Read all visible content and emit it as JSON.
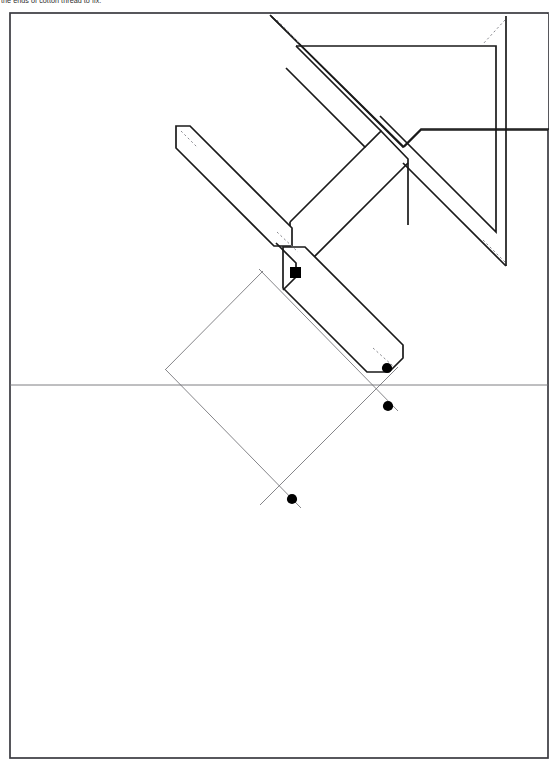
{
  "document": {
    "caption_text": "the ends of cotton thread to fix.",
    "page_width": 555,
    "page_height": 766,
    "background_color": "#ffffff"
  },
  "frame": {
    "name": "page-border",
    "x": 10,
    "y": 13,
    "width": 538,
    "height": 745,
    "stroke_color": "#3a3a40",
    "stroke_width": 1.6
  },
  "figure": {
    "line_color": "#1a1a1a",
    "thin_line_color": "#6f6f74",
    "dotted_line_color": "#8a8a90",
    "dot_color": "#000000",
    "outline_stroke_width": 1.6,
    "thin_stroke_width": 0.8,
    "dotted_stroke_width": 0.8,
    "horizontal_guide": {
      "name": "horizontal-centre-line",
      "y": 385,
      "x_start": 10,
      "x_end": 548
    },
    "solid_shapes": [
      {
        "name": "main-chevron-body",
        "points": "272,17 272,23 390,141 390,141 403,128 291,16"
      },
      {
        "name": "upper-chevron-outer",
        "points": "274,17 397,140 431,106 542,106 542,18"
      }
    ],
    "dots": [
      {
        "name": "vertex-dot-junction",
        "cx": 296,
        "cy": 273,
        "r": 5.2,
        "shape": "square"
      },
      {
        "name": "vertex-dot-lower-arm-end",
        "cx": 387,
        "cy": 368,
        "r": 5.0,
        "shape": "circle"
      },
      {
        "name": "vertex-dot-right-lower",
        "cx": 388,
        "cy": 406,
        "r": 5.0,
        "shape": "circle"
      },
      {
        "name": "vertex-dot-bottom",
        "cx": 292,
        "cy": 499,
        "r": 5.0,
        "shape": "circle"
      }
    ],
    "construction_lines": [
      {
        "name": "diagonal-line-a",
        "x1": 259,
        "y1": 270,
        "x2": 396,
        "y2": 411
      },
      {
        "name": "diagonal-line-b",
        "x1": 166,
        "y1": 371,
        "x2": 300,
        "y2": 507
      },
      {
        "name": "diagonal-line-c",
        "x1": 262,
        "y1": 272,
        "x2": 166,
        "y2": 369
      },
      {
        "name": "diagonal-line-d",
        "x1": 397,
        "y1": 368,
        "x2": 261,
        "y2": 504
      }
    ]
  },
  "labels": {
    "figure_caption": "the ends of cotton thread to fix."
  }
}
